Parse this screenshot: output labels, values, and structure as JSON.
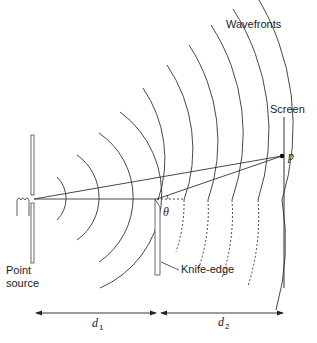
{
  "figure": {
    "labels": {
      "wavefronts": "Wavefronts",
      "screen": "Screen",
      "point_p": "p",
      "theta": "θ",
      "point_source_line1": "Point",
      "point_source_line2": "source",
      "knife_edge": "Knife-edge",
      "d1": "d",
      "d1_sub": "1",
      "d2": "d",
      "d2_sub": "2"
    },
    "colors": {
      "stroke": "#333333",
      "background": "#ffffff"
    }
  }
}
